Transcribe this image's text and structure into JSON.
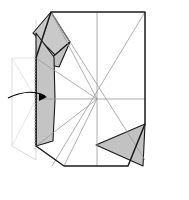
{
  "figure": {
    "type": "paper-folding-diagram",
    "canvas": {
      "width": 189,
      "height": 200,
      "background": "#ffffff"
    },
    "colors": {
      "outline": "#1a1a1a",
      "crease": "#9a9a9a",
      "shade_dark": "#b8b8b8",
      "shade_mid": "#c9c9c9",
      "shade_light": "#e8e8e8",
      "ghost": "#d8d8d8",
      "fold_dotted": "#b0b0b0",
      "arrow": "#000000"
    },
    "center_point": {
      "x": 97,
      "y": 99
    },
    "sheet_outline_points": "51,12 145,12 145,124 128,166 97,166 64,166 36,146 36,58",
    "creases": [
      {
        "name": "vertical-center-crease",
        "points": "97,12 97,166"
      },
      {
        "name": "horizontal-center-crease",
        "points": "36,99 145,99"
      },
      {
        "name": "diagonal-crease-nw-se",
        "points": "51,12 145,160"
      },
      {
        "name": "diagonal-crease-ne-sw",
        "points": "145,12 52,166"
      },
      {
        "name": "diagonal-crease-left-upper",
        "points": "36,58 97,99"
      },
      {
        "name": "diagonal-crease-left-lower",
        "points": "36,146 97,99"
      },
      {
        "name": "crease-to-bottom-left",
        "points": "97,99 64,166"
      },
      {
        "name": "crease-to-top-left",
        "points": "97,99 51,12"
      },
      {
        "name": "ghost-crease-a",
        "points": "12,58 36,99"
      },
      {
        "name": "ghost-crease-b",
        "points": "12,146 36,99"
      },
      {
        "name": "ghost-crease-c",
        "points": "12,58 36,58"
      }
    ],
    "shaded_regions": [
      {
        "name": "top-left-flap-upper",
        "points": "51,12 70,42 55,55 33,33",
        "fill": "#c9c9c9"
      },
      {
        "name": "top-left-flap-lower",
        "points": "55,55 70,42 59,67 41,63",
        "fill": "#c0c0c0"
      },
      {
        "name": "left-main-flap",
        "points": "36,33 54,57 55,100 53,141 36,146",
        "fill": "#c4c4c4"
      },
      {
        "name": "bottom-right-triangle",
        "points": "145,124 143,166 96,145",
        "fill": "#c2c2c2"
      }
    ],
    "ghost_outline": {
      "name": "pre-fold-ghost-outline",
      "points": "12,58 12,146 36,160 36,20",
      "stroke": "#d8d8d8"
    },
    "fold_line": {
      "name": "vertical-dotted-fold-line",
      "x": 35,
      "y1": 55,
      "y2": 150,
      "style": "dotted"
    },
    "arrow": {
      "name": "fold-direction-arrow",
      "path": "M 8,98 C 20,92 34,90 45,96",
      "head_at": {
        "x": 46,
        "y": 97
      },
      "direction": "right"
    }
  }
}
